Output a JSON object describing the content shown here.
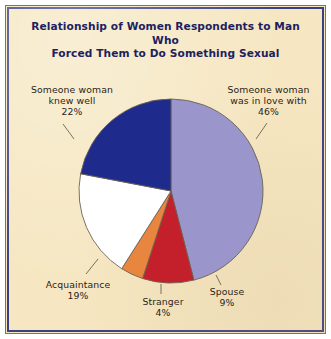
{
  "figure": {
    "background_color": "#f6e7c2",
    "border_color": "#3b3f86",
    "title_color": "#1c2260",
    "label_color": "#2a2418"
  },
  "chart_data": {
    "type": "pie",
    "title": "Relationship of Women Respondents to Man Who Forced Them to Do Something Sexual",
    "title_line1": "Relationship of Women Respondents to Man Who",
    "title_line2": "Forced Them to Do Something Sexual",
    "xlabel": "",
    "ylabel": "",
    "legend": "none",
    "grid": false,
    "units": "percent",
    "total": 100,
    "categories": [
      "Someone woman was in love with",
      "Spouse",
      "Stranger",
      "Acquaintance",
      "Someone woman knew well"
    ],
    "values": [
      46,
      9,
      4,
      19,
      22
    ],
    "colors": [
      "#9a96cc",
      "#c4202b",
      "#e8853e",
      "#ffffff",
      "#1e2a8c"
    ],
    "slices": [
      {
        "label": "Someone woman was in love with",
        "value": 46,
        "value_label": "46%",
        "color": "#9a96cc"
      },
      {
        "label": "Spouse",
        "value": 9,
        "value_label": "9%",
        "color": "#c4202b"
      },
      {
        "label": "Stranger",
        "value": 4,
        "value_label": "4%",
        "color": "#e8853e"
      },
      {
        "label": "Acquaintance",
        "value": 19,
        "value_label": "19%",
        "color": "#ffffff"
      },
      {
        "label": "Someone woman knew well",
        "value": 22,
        "value_label": "22%",
        "color": "#1e2a8c"
      }
    ]
  },
  "labels": {
    "knew_well": "Someone woman\nknew well\n22%",
    "in_love": "Someone woman\nwas in love with\n46%",
    "acquaintance": "Acquaintance\n19%",
    "stranger": "Stranger\n4%",
    "spouse": "Spouse\n9%"
  }
}
